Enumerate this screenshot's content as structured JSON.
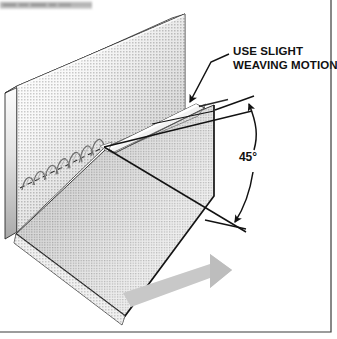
{
  "figure": {
    "background_color": "#ffffff",
    "border_color": "#3a3a3a",
    "width": 337,
    "height": 339
  },
  "scan_artifact": {
    "name": "cropped-caption-strip",
    "color": "#b9b9b9",
    "visible": true
  },
  "annotations": {
    "weaving_label": {
      "line1": "USE SLIGHT",
      "line2": "WEAVING MOTION",
      "color": "#111111"
    },
    "angle_label": {
      "value": "45°",
      "color": "#111111"
    }
  },
  "parts": {
    "vertical_plate": {
      "name": "vertical-plate",
      "fill_light": "#fbfbfb",
      "fill_dark": "#9a9a9a",
      "edge_color": "#2b2b2b"
    },
    "horizontal_plate": {
      "name": "horizontal-plate",
      "fill_light": "#f2f2f2",
      "fill_dark": "#8f8f8f",
      "edge_color": "#1d1d1d"
    },
    "weld_bead": {
      "name": "weld-bead",
      "ripple_count": 7,
      "color": "#6d6d6d",
      "centerline_style": "dashed"
    },
    "electrode": {
      "name": "electrode",
      "fill": "#ededed",
      "outline": "#3a3a3a"
    },
    "travel_arrow": {
      "name": "travel-direction-arrow",
      "fill": "#c6c6c6",
      "direction": "right"
    },
    "angle_dimension": {
      "name": "angle-dimension-arc",
      "color": "#121212",
      "arrowheads": 2
    },
    "leader_line": {
      "name": "leader-line-weaving",
      "color": "#121212",
      "arrowheads": 1
    }
  }
}
